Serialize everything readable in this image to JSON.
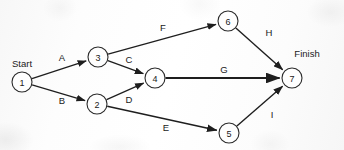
{
  "diagram": {
    "type": "activity-on-arrow network diagram",
    "background_color": "#fdfdfd",
    "stroke_color": "#1e1e1e",
    "node_fill_color": "#fefefe",
    "canvas": {
      "width": 344,
      "height": 150
    },
    "terminal_labels": [
      {
        "id": "start-label",
        "text": "Start",
        "x": 22,
        "y": 63
      },
      {
        "id": "finish-label",
        "text": "Finish",
        "x": 307,
        "y": 53
      }
    ],
    "nodes": [
      {
        "id": "1",
        "label": "1",
        "cx": 22,
        "cy": 82,
        "r": 10
      },
      {
        "id": "2",
        "label": "2",
        "cx": 97,
        "cy": 104,
        "r": 10
      },
      {
        "id": "3",
        "label": "3",
        "cx": 98,
        "cy": 57,
        "r": 10
      },
      {
        "id": "4",
        "label": "4",
        "cx": 155,
        "cy": 78,
        "r": 10
      },
      {
        "id": "5",
        "label": "5",
        "cx": 229,
        "cy": 133,
        "r": 10
      },
      {
        "id": "6",
        "label": "6",
        "cx": 228,
        "cy": 21,
        "r": 10
      },
      {
        "id": "7",
        "label": "7",
        "cx": 292,
        "cy": 78,
        "r": 10
      }
    ],
    "edges": [
      {
        "id": "edge-a",
        "label": "A",
        "from": "1",
        "to": "3",
        "label_x": 62,
        "label_y": 57,
        "width": 1.3
      },
      {
        "id": "edge-b",
        "label": "B",
        "from": "1",
        "to": "2",
        "label_x": 62,
        "label_y": 100,
        "width": 1.3
      },
      {
        "id": "edge-c",
        "label": "C",
        "from": "3",
        "to": "4",
        "label_x": 129,
        "label_y": 59,
        "width": 1.3
      },
      {
        "id": "edge-d",
        "label": "D",
        "from": "2",
        "to": "4",
        "label_x": 129,
        "label_y": 99,
        "width": 1.3
      },
      {
        "id": "edge-e",
        "label": "E",
        "from": "2",
        "to": "5",
        "label_x": 166,
        "label_y": 127,
        "width": 1.5
      },
      {
        "id": "edge-f",
        "label": "F",
        "from": "3",
        "to": "6",
        "label_x": 163,
        "label_y": 27,
        "width": 1.3
      },
      {
        "id": "edge-g",
        "label": "G",
        "from": "4",
        "to": "7",
        "label_x": 224,
        "label_y": 69,
        "width": 2.1
      },
      {
        "id": "edge-h",
        "label": "H",
        "from": "6",
        "to": "7",
        "label_x": 269,
        "label_y": 32,
        "width": 1.4
      },
      {
        "id": "edge-i",
        "label": "I",
        "from": "5",
        "to": "7",
        "label_x": 272,
        "label_y": 114,
        "width": 1.4
      }
    ]
  }
}
